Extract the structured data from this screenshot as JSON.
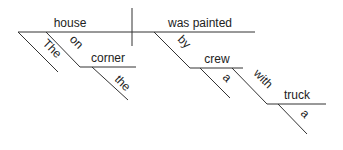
{
  "diagram": {
    "type": "sentence-diagram",
    "subject": "house",
    "verb": "was painted",
    "modifiers": {
      "subject_article": "The",
      "subject_preposition": "on",
      "preposition_object": "corner",
      "object_article": "the",
      "verb_preposition": "by",
      "agent": "crew",
      "agent_article": "a",
      "agent_preposition": "with",
      "instrument": "truck",
      "instrument_article": "a"
    }
  }
}
